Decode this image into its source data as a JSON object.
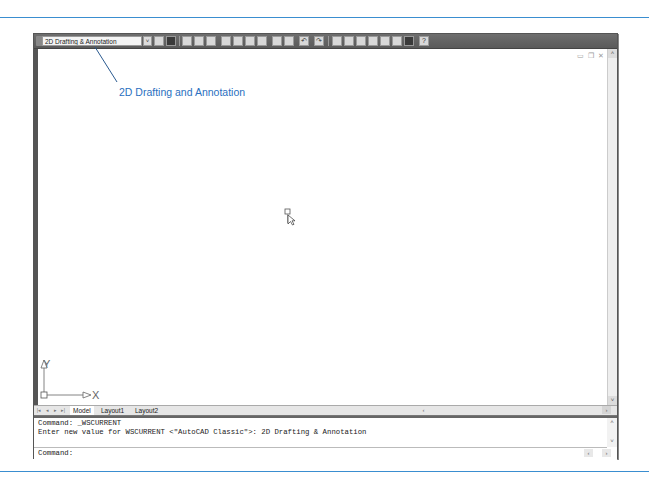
{
  "figure": {
    "callout_label": "2D Drafting and Annotation",
    "accent_color": "#2a70c0",
    "rule_color": "#3a8ed0"
  },
  "toolbar": {
    "workspace_value": "2D Drafting & Annotation",
    "workspace_dropdown_icon": "chevron-down-icon",
    "icons": [
      "workspace-settings-icon",
      "my-workspace-icon",
      "new-icon",
      "open-icon",
      "save-icon",
      "plot-icon",
      "plot-preview-icon",
      "publish-icon",
      "3d-dwf-icon",
      "cut-icon",
      "copy-icon",
      "undo-icon",
      "redo-icon",
      "pan-icon",
      "zoom-realtime-icon",
      "zoom-window-icon",
      "zoom-previous-icon",
      "properties-icon",
      "design-center-icon",
      "tool-palettes-icon",
      "calculator-icon",
      "help-icon"
    ],
    "glyphs": {
      "dropdown": "˅",
      "undo": "↶",
      "redo": "↷",
      "help": "?"
    }
  },
  "mdi_controls": {
    "minimize": "▭",
    "restore": "❐",
    "close": "✕"
  },
  "scrollbars": {
    "up": "˄",
    "down": "˅",
    "left": "‹",
    "right": "›"
  },
  "ucs": {
    "x_label": "X",
    "y_label": "Y"
  },
  "tabs": {
    "nav": [
      "|◂",
      "◂",
      "▸",
      "▸|"
    ],
    "items": [
      {
        "label": "Model",
        "active": true
      },
      {
        "label": "Layout1",
        "active": false
      },
      {
        "label": "Layout2",
        "active": false
      }
    ]
  },
  "command_line": {
    "history": [
      "Command: _WSCURRENT",
      "Enter new value for WSCURRENT <\"AutoCAD Classic\">: 2D Drafting & Annotation"
    ],
    "prompt": "Command:"
  }
}
